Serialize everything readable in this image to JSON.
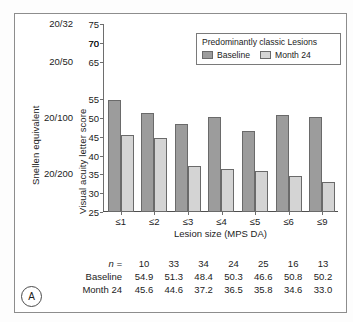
{
  "figure": {
    "panel_letter": "A"
  },
  "axes": {
    "left_outer_title": "Snellen equivalent",
    "left_inner_title": "Visual acuity letter score",
    "xlabel": "Lesion size (MPS DA)",
    "snellen_labels": [
      {
        "text": "20/32",
        "value": 75
      },
      {
        "text": "20/50",
        "value": 65
      },
      {
        "text": "20/100",
        "value": 50
      },
      {
        "text": "20/200",
        "value": 35
      }
    ]
  },
  "legend": {
    "title": "Predominantly classic Lesions",
    "entries": [
      {
        "label": "Baseline",
        "color": "#9c9c9c"
      },
      {
        "label": "Month 24",
        "color": "#d4d4d4"
      }
    ]
  },
  "table": {
    "rows": [
      {
        "label": "n =",
        "italic_label": true,
        "values": [
          "10",
          "33",
          "34",
          "24",
          "25",
          "16",
          "13"
        ]
      },
      {
        "label": "Baseline",
        "italic_label": false,
        "values": [
          "54.9",
          "51.3",
          "48.4",
          "50.3",
          "46.6",
          "50.8",
          "50.2"
        ]
      },
      {
        "label": "Month 24",
        "italic_label": false,
        "values": [
          "45.6",
          "44.6",
          "37.2",
          "36.5",
          "35.8",
          "34.6",
          "33.0"
        ]
      }
    ]
  },
  "chart_data": {
    "type": "bar",
    "title": "Predominantly classic Lesions",
    "xlabel": "Lesion size (MPS DA)",
    "ylabel": "Visual acuity letter score",
    "secondary_ylabel": "Snellen equivalent",
    "categories": [
      "≤1",
      "≤2",
      "≤3",
      "≤4",
      "≤5",
      "≤6",
      "≤9"
    ],
    "series": [
      {
        "name": "Baseline",
        "color": "#9c9c9c",
        "values": [
          54.9,
          51.3,
          48.4,
          50.3,
          46.6,
          50.8,
          50.2
        ]
      },
      {
        "name": "Month 24",
        "color": "#d4d4d4",
        "values": [
          45.6,
          44.6,
          37.2,
          36.5,
          35.8,
          34.6,
          33.0
        ]
      }
    ],
    "n_per_category": [
      10,
      33,
      34,
      24,
      25,
      16,
      13
    ],
    "ylim": [
      25,
      75
    ],
    "yticks": [
      25,
      30,
      35,
      40,
      45,
      50,
      55,
      70,
      65,
      70,
      75
    ],
    "ytick_labels": [
      "25",
      "30",
      "35",
      "40",
      "45",
      "50",
      "55",
      "70",
      "65",
      "70",
      "75"
    ],
    "grid": false,
    "legend_position": "top-right"
  }
}
